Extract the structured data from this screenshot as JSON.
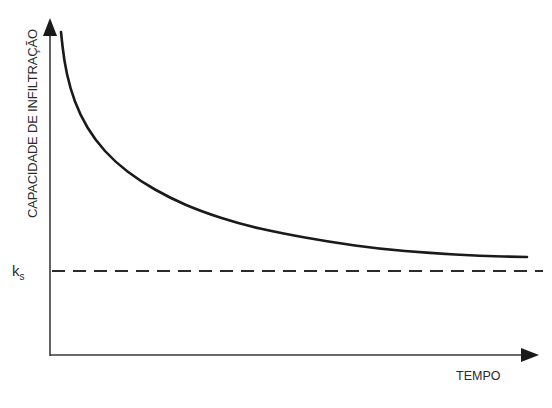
{
  "chart_data": {
    "type": "line",
    "title": "",
    "xlabel": "TEMPO",
    "ylabel": "CAPACIDADE DE INFILTRAÇÃO",
    "grid": false,
    "legend": null,
    "series": [
      {
        "name": "capacidade de infiltração (decaimento)",
        "style": "solid",
        "points_px": [
          [
            61,
            32
          ],
          [
            64,
            60
          ],
          [
            70,
            88
          ],
          [
            80,
            115
          ],
          [
            95,
            140
          ],
          [
            115,
            162
          ],
          [
            140,
            181
          ],
          [
            170,
            198
          ],
          [
            200,
            211
          ],
          [
            240,
            224
          ],
          [
            280,
            233
          ],
          [
            330,
            242
          ],
          [
            380,
            249
          ],
          [
            430,
            253
          ],
          [
            480,
            256
          ],
          [
            527,
            257
          ]
        ]
      },
      {
        "name": "ks",
        "style": "dashed",
        "y_px": 271,
        "x_range_px": [
          52,
          543
        ]
      }
    ],
    "annotations": [
      {
        "text": "k",
        "subscript": "s",
        "position": "y-axis at dashed line"
      }
    ],
    "axis_ranges": {
      "x": "unlabeled",
      "y": "unlabeled"
    }
  },
  "labels": {
    "y_axis": "CAPACIDADE DE INFILTRAÇÃO",
    "x_axis": "TEMPO",
    "ks_main": "k",
    "ks_sub": "s"
  }
}
